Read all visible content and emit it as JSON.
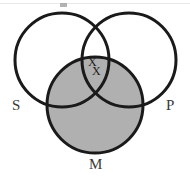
{
  "figure": {
    "name": "syllogism-venn-diagram",
    "background_color": "#ffffff",
    "stroke_color": "#1a1a1a",
    "shade_color": "#b0b0b0",
    "label_color": "#3a3a3a",
    "width": 190,
    "height": 181
  },
  "labels": {
    "subject": "S",
    "predicate": "P",
    "middle": "M"
  },
  "marks": {
    "x_upper": "X",
    "x_lower": "X"
  },
  "chart_data": {
    "type": "diagram",
    "diagram_kind": "venn",
    "title": "",
    "sets": [
      {
        "id": "S",
        "label": "S",
        "cx": 62,
        "cy": 60,
        "r": 47,
        "fill": "none",
        "stroke": "#1a1a1a",
        "stroke_width": 3,
        "label_x": 12,
        "label_y": 98
      },
      {
        "id": "P",
        "label": "P",
        "cx": 129,
        "cy": 60,
        "r": 47,
        "fill": "none",
        "stroke": "#1a1a1a",
        "stroke_width": 3,
        "label_x": 166,
        "label_y": 98
      },
      {
        "id": "M",
        "label": "M",
        "cx": 95,
        "cy": 105,
        "r": 48,
        "fill": "#b0b0b0",
        "stroke": "#1a1a1a",
        "stroke_width": 3,
        "label_x": 89,
        "label_y": 157
      }
    ],
    "region_marks": [
      {
        "region": "S-and-P-not-M",
        "symbol": "X",
        "x": 91,
        "y": 62
      },
      {
        "region": "S-and-P-not-M",
        "symbol": "X",
        "x": 95,
        "y": 71
      }
    ],
    "shaded_regions": [
      "M"
    ],
    "legend": "none",
    "grid": false
  }
}
